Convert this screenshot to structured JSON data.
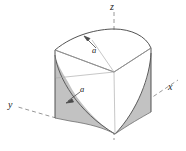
{
  "figure": {
    "kind": "3d-solid-diagram",
    "background_color": "#ffffff",
    "line_color": "#4a4a4a",
    "dash_color": "#8c8c8c",
    "shade_color": "#bdbdbd",
    "shade_edge_color": "#6e6e6e",
    "label_color": "#1a1a1a"
  },
  "axes": [
    {
      "name": "z-axis",
      "label": "z",
      "style": "dashed",
      "direction": "up"
    },
    {
      "name": "x-axis",
      "label": "x",
      "style": "dashed",
      "direction": "lower-right"
    },
    {
      "name": "y-axis",
      "label": "y",
      "style": "dashed",
      "direction": "lower-left"
    }
  ],
  "annotations": [
    {
      "name": "radius-top",
      "label": "a",
      "leader": "arrow to upper arc"
    },
    {
      "name": "radius-lower",
      "label": "a",
      "leader": "arrow to lower-left curve"
    }
  ],
  "shaded_regions": [
    {
      "name": "left-shaded-region",
      "fill": "#bdbdbd"
    },
    {
      "name": "right-shaded-region",
      "fill": "#bdbdbd"
    }
  ]
}
